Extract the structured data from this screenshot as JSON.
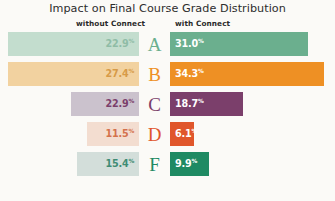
{
  "chart_data": {
    "type": "bar",
    "title": "Impact on Final Course Grade Distribution",
    "subtype": "diverging-horizontal-bar",
    "xlabel": "",
    "ylabel": "",
    "categories": [
      "A",
      "B",
      "C",
      "D",
      "F"
    ],
    "series": [
      {
        "name": "without Connect",
        "side": "left",
        "values": [
          22.9,
          27.4,
          22.9,
          11.5,
          15.4
        ],
        "value_labels": [
          "22.9",
          "27.4",
          "22.9",
          "11.5",
          "15.4"
        ]
      },
      {
        "name": "with Connect",
        "side": "right",
        "values": [
          31.0,
          34.3,
          18.7,
          6.1,
          9.9
        ],
        "value_labels": [
          "31.0",
          "34.3",
          "18.7",
          "6.1",
          "9.9"
        ]
      }
    ],
    "unit_suffix": "%",
    "xlim": [
      0,
      40
    ],
    "grid": false,
    "legend_position": "top",
    "row_colors": [
      "#6BAF8E",
      "#EE9024",
      "#7B3F6B",
      "#E0562B",
      "#1F8A63"
    ],
    "row_colors_muted": [
      "#C3DDCE",
      "#F2D2A0",
      "#CBC2CD",
      "#F3DDD0",
      "#D3DEDA"
    ],
    "background_color": "#FBFAF7"
  },
  "header": {
    "title": "Impact on Final Course Grade Distribution",
    "left_label": "without Connect",
    "right_label": "with Connect"
  },
  "rows": [
    {
      "grade": "A",
      "accent": "#6BAF8E",
      "muted": "#C3DDCE",
      "left_value": "22.9",
      "left_pct": "%",
      "left_width": 131,
      "left_text_color": "#8FBCA6",
      "right_value": "31.0",
      "right_pct": "%",
      "right_width": 138
    },
    {
      "grade": "B",
      "accent": "#EE9024",
      "muted": "#F2D2A0",
      "left_value": "27.4",
      "left_pct": "%",
      "left_width": 131,
      "left_text_color": "#D79B48",
      "right_value": "34.3",
      "right_pct": "%",
      "right_width": 154
    },
    {
      "grade": "C",
      "accent": "#7B3F6B",
      "muted": "#CBC2CD",
      "left_value": "22.9",
      "left_pct": "%",
      "left_width": 68,
      "left_text_color": "#7B3F6B",
      "right_value": "18.7",
      "right_pct": "%",
      "right_width": 73
    },
    {
      "grade": "D",
      "accent": "#E0562B",
      "muted": "#F3DDD0",
      "left_value": "11.5",
      "left_pct": "%",
      "left_width": 52,
      "left_text_color": "#D4724C",
      "right_value": "6.1",
      "right_pct": "%",
      "right_width": 24
    },
    {
      "grade": "F",
      "accent": "#1F8A63",
      "muted": "#D3DEDA",
      "left_value": "15.4",
      "left_pct": "%",
      "left_width": 62,
      "left_text_color": "#3F8C74",
      "right_value": "9.9",
      "right_pct": "%",
      "right_width": 39
    }
  ]
}
